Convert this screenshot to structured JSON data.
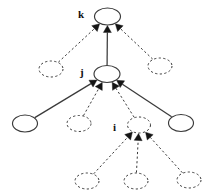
{
  "diagram": {
    "type": "directed-graph",
    "background_color": "#ffffff",
    "stroke_color": "#3a3a3a",
    "label_color": "#111111",
    "labels": {
      "k": "k",
      "j": "j",
      "i": "i"
    },
    "nodes": [
      {
        "id": "k",
        "label": "k",
        "style": "solid",
        "cx": 107.5,
        "cy": 16.5,
        "rx": 13.0,
        "ry": 8.5,
        "label_x": 78,
        "label_y": 9
      },
      {
        "id": "k_left",
        "label": "",
        "style": "dashed",
        "cx": 51.0,
        "cy": 69.0,
        "rx": 12.0,
        "ry": 8.0
      },
      {
        "id": "k_right",
        "label": "",
        "style": "dashed",
        "cx": 160.0,
        "cy": 66.0,
        "rx": 12.0,
        "ry": 8.0
      },
      {
        "id": "j",
        "label": "j",
        "style": "solid",
        "cx": 107.0,
        "cy": 74.0,
        "rx": 13.0,
        "ry": 8.5,
        "label_x": 80,
        "label_y": 67
      },
      {
        "id": "j_c1",
        "label": "",
        "style": "solid",
        "cx": 25.0,
        "cy": 123.5,
        "rx": 12.5,
        "ry": 8.5
      },
      {
        "id": "j_c2",
        "label": "",
        "style": "dashed",
        "cx": 79.0,
        "cy": 123.5,
        "rx": 12.0,
        "ry": 8.0
      },
      {
        "id": "j_c4",
        "label": "",
        "style": "solid",
        "cx": 181.0,
        "cy": 123.0,
        "rx": 12.5,
        "ry": 8.5
      },
      {
        "id": "i",
        "label": "i",
        "style": "dashed",
        "cx": 139.0,
        "cy": 125.0,
        "rx": 11.5,
        "ry": 8.0,
        "label_x": 113,
        "label_y": 122
      },
      {
        "id": "i_c1",
        "label": "",
        "style": "dashed",
        "cx": 87.0,
        "cy": 181.0,
        "rx": 12.0,
        "ry": 8.0
      },
      {
        "id": "i_c2",
        "label": "",
        "style": "dashed",
        "cx": 136.0,
        "cy": 181.0,
        "rx": 12.0,
        "ry": 8.0
      },
      {
        "id": "i_c3",
        "label": "",
        "style": "dashed",
        "cx": 189.0,
        "cy": 180.0,
        "rx": 12.0,
        "ry": 8.0
      }
    ],
    "edges": [
      {
        "from": "k_left",
        "to": "k",
        "style": "dashed",
        "arrow": true
      },
      {
        "from": "j",
        "to": "k",
        "style": "solid",
        "arrow": true
      },
      {
        "from": "k_right",
        "to": "k",
        "style": "dashed",
        "arrow": true
      },
      {
        "from": "j_c1",
        "to": "j",
        "style": "solid",
        "arrow": true
      },
      {
        "from": "j_c2",
        "to": "j",
        "style": "dashed",
        "arrow": true
      },
      {
        "from": "i",
        "to": "j",
        "style": "dashed",
        "arrow": true
      },
      {
        "from": "j_c4",
        "to": "j",
        "style": "solid",
        "arrow": true
      },
      {
        "from": "i_c1",
        "to": "i",
        "style": "dashed",
        "arrow": true
      },
      {
        "from": "i_c2",
        "to": "i",
        "style": "dashed",
        "arrow": true
      },
      {
        "from": "i_c3",
        "to": "i",
        "style": "dashed",
        "arrow": true
      }
    ]
  }
}
